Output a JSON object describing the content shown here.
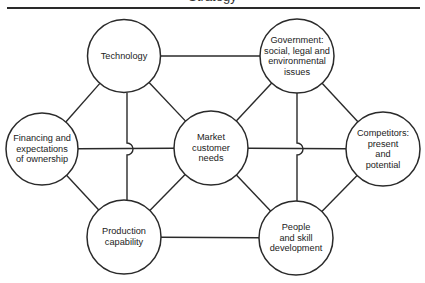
{
  "header": {
    "title_fragment": "Strategy"
  },
  "nodes": [
    {
      "id": "technology",
      "label": "Technology"
    },
    {
      "id": "government",
      "label": "Government: social, legal and environmental issues"
    },
    {
      "id": "financing",
      "label": "Financing and expectations of ownership"
    },
    {
      "id": "market",
      "label": "Market customer needs"
    },
    {
      "id": "competitors",
      "label": "Competitors: present and potential"
    },
    {
      "id": "production",
      "label": "Production capability"
    },
    {
      "id": "people",
      "label": "People and skill development"
    }
  ],
  "edges": [
    [
      "technology",
      "government"
    ],
    [
      "technology",
      "financing"
    ],
    [
      "technology",
      "market"
    ],
    [
      "technology",
      "production"
    ],
    [
      "government",
      "market"
    ],
    [
      "government",
      "competitors"
    ],
    [
      "government",
      "people"
    ],
    [
      "financing",
      "market"
    ],
    [
      "financing",
      "production"
    ],
    [
      "market",
      "competitors"
    ],
    [
      "market",
      "production"
    ],
    [
      "market",
      "people"
    ],
    [
      "competitors",
      "people"
    ],
    [
      "production",
      "people"
    ]
  ],
  "colors": {
    "stroke": "#2a2a2a",
    "background": "#ffffff",
    "text": "#222222"
  }
}
